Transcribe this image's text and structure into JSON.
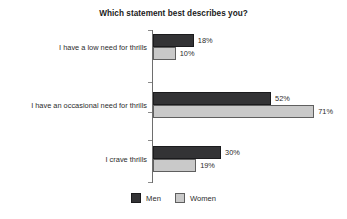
{
  "chart_data": {
    "type": "bar",
    "orientation": "horizontal",
    "title": "Which statement best describes you?",
    "xlabel": "",
    "ylabel": "",
    "grid": false,
    "legend_position": "bottom-center",
    "value_suffix": "%",
    "xlim": [
      0,
      71
    ],
    "axis_max_for_scale": 71,
    "categories": [
      "I have a low need for thrills",
      "I have an occasional need for thrills",
      "I crave thrills"
    ],
    "series": [
      {
        "name": "Men",
        "color": "#333335",
        "values": [
          18,
          52,
          30
        ],
        "labels": [
          "18%",
          "52%",
          "30%"
        ]
      },
      {
        "name": "Women",
        "color": "#c9c9c9",
        "values": [
          10,
          71,
          19
        ],
        "labels": [
          "10%",
          "71%",
          "19%"
        ]
      }
    ]
  },
  "colors": {
    "men": "#333335",
    "women": "#c9c9c9",
    "axis": "#6e6e6e",
    "text": "#2b2b2b",
    "background": "#ffffff"
  }
}
